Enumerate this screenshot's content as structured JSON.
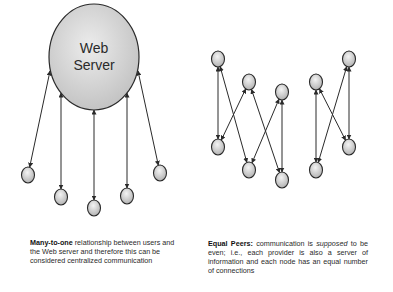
{
  "left_diagram": {
    "server": {
      "label_line1": "Web",
      "label_line2": "Server",
      "cx": 94,
      "cy": 57,
      "rx": 45,
      "ry": 53
    },
    "clients": [
      {
        "id": "c1",
        "cx": 28,
        "cy": 175
      },
      {
        "id": "c2",
        "cx": 61,
        "cy": 197
      },
      {
        "id": "c3",
        "cx": 94,
        "cy": 208
      },
      {
        "id": "c4",
        "cx": 127,
        "cy": 196
      },
      {
        "id": "c5",
        "cx": 160,
        "cy": 173
      }
    ],
    "caption": {
      "bold": "Many-to-one",
      "text": " relationship between users and the Web server and therefore this can be considered centralized communication"
    }
  },
  "right_diagram": {
    "nodes": [
      {
        "id": "A",
        "cx": 218,
        "cy": 59
      },
      {
        "id": "B",
        "cx": 249,
        "cy": 82
      },
      {
        "id": "C",
        "cx": 282,
        "cy": 92
      },
      {
        "id": "D",
        "cx": 218,
        "cy": 147
      },
      {
        "id": "E",
        "cx": 249,
        "cy": 170
      },
      {
        "id": "F",
        "cx": 282,
        "cy": 180
      },
      {
        "id": "G",
        "cx": 316,
        "cy": 82
      },
      {
        "id": "H",
        "cx": 349,
        "cy": 59
      },
      {
        "id": "I",
        "cx": 316,
        "cy": 170
      },
      {
        "id": "J",
        "cx": 349,
        "cy": 147
      }
    ],
    "edges": [
      [
        "A",
        "D"
      ],
      [
        "A",
        "E"
      ],
      [
        "B",
        "D"
      ],
      [
        "B",
        "F"
      ],
      [
        "C",
        "E"
      ],
      [
        "C",
        "F"
      ],
      [
        "G",
        "I"
      ],
      [
        "G",
        "J"
      ],
      [
        "H",
        "I"
      ],
      [
        "H",
        "J"
      ]
    ],
    "caption": {
      "bold": "Equal Peers:",
      "text_before_italic": " communication is ",
      "italic": "supposed",
      "text_after_italic": " to be even; i.e., each provider is also a server of information and each node has an equal number of connections"
    }
  },
  "colors": {
    "stroke": "#2a2a2a",
    "node_fill_light": "#f2f2f2",
    "node_fill_dark": "#b0b0b0",
    "server_fill_light": "#ececec",
    "server_fill_dark": "#bdbdbd"
  }
}
